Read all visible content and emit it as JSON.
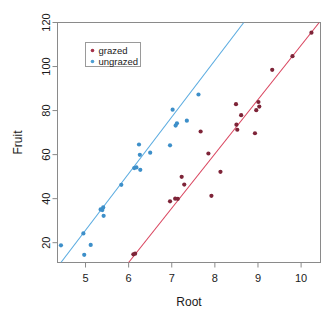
{
  "chart_data": {
    "type": "scatter",
    "title": "",
    "xlabel": "Root",
    "ylabel": "Fruit",
    "xlim": [
      4.35,
      10.45
    ],
    "ylim": [
      11.0,
      120.0
    ],
    "xticks": [
      5,
      6,
      7,
      8,
      9,
      10
    ],
    "yticks": [
      20,
      40,
      60,
      80,
      100,
      120
    ],
    "xtick_labels": [
      "5",
      "6",
      "7",
      "8",
      "9",
      "10"
    ],
    "ytick_labels": [
      "20",
      "40",
      "60",
      "80",
      "100",
      "120"
    ],
    "grid": false,
    "legend_position": "top-left",
    "legend": [
      {
        "name": "grazed",
        "color": "#a5324a",
        "marker": "filled-circle"
      },
      {
        "name": "ungrazed",
        "color": "#4e9fd4",
        "marker": "filled-circle"
      }
    ],
    "series": [
      {
        "name": "grazed",
        "color": "#7e2438",
        "marker": "filled-circle",
        "points": [
          {
            "x": 6.11,
            "y": 14.7
          },
          {
            "x": 6.15,
            "y": 15.0
          },
          {
            "x": 6.96,
            "y": 38.8
          },
          {
            "x": 7.08,
            "y": 40.0
          },
          {
            "x": 7.14,
            "y": 39.9
          },
          {
            "x": 7.23,
            "y": 49.9
          },
          {
            "x": 7.29,
            "y": 46.4
          },
          {
            "x": 7.67,
            "y": 70.5
          },
          {
            "x": 7.85,
            "y": 60.5
          },
          {
            "x": 7.92,
            "y": 41.3
          },
          {
            "x": 8.13,
            "y": 52.2
          },
          {
            "x": 8.49,
            "y": 82.9
          },
          {
            "x": 8.5,
            "y": 73.6
          },
          {
            "x": 8.52,
            "y": 71.3
          },
          {
            "x": 8.61,
            "y": 77.9
          },
          {
            "x": 8.93,
            "y": 69.7
          },
          {
            "x": 8.96,
            "y": 80.2
          },
          {
            "x": 9.01,
            "y": 83.9
          },
          {
            "x": 9.03,
            "y": 81.8
          },
          {
            "x": 9.33,
            "y": 98.5
          },
          {
            "x": 9.8,
            "y": 104.7
          },
          {
            "x": 10.24,
            "y": 115.4
          }
        ]
      },
      {
        "name": "ungrazed",
        "color": "#3d8fc9",
        "marker": "filled-circle",
        "points": [
          {
            "x": 4.43,
            "y": 18.8
          },
          {
            "x": 4.95,
            "y": 24.2
          },
          {
            "x": 4.97,
            "y": 14.5
          },
          {
            "x": 5.12,
            "y": 19.0
          },
          {
            "x": 5.35,
            "y": 35.1
          },
          {
            "x": 5.39,
            "y": 34.8
          },
          {
            "x": 5.42,
            "y": 32.2
          },
          {
            "x": 5.41,
            "y": 36.0
          },
          {
            "x": 5.83,
            "y": 46.3
          },
          {
            "x": 6.13,
            "y": 53.9
          },
          {
            "x": 6.18,
            "y": 54.2
          },
          {
            "x": 6.24,
            "y": 64.6
          },
          {
            "x": 6.27,
            "y": 53.1
          },
          {
            "x": 6.26,
            "y": 59.9
          },
          {
            "x": 6.5,
            "y": 60.9
          },
          {
            "x": 6.96,
            "y": 64.2
          },
          {
            "x": 7.02,
            "y": 80.4
          },
          {
            "x": 7.09,
            "y": 73.2
          },
          {
            "x": 7.12,
            "y": 74.2
          },
          {
            "x": 7.35,
            "y": 75.4
          },
          {
            "x": 7.62,
            "y": 87.3
          }
        ]
      }
    ],
    "fit_lines": [
      {
        "name": "grazed-fit",
        "color": "#d9455f",
        "x_start": 6.0,
        "y_start": 11.0,
        "x_end": 10.42,
        "y_end": 120.0
      },
      {
        "name": "ungrazed-fit",
        "color": "#5aabe0",
        "x_start": 4.43,
        "y_start": 11.0,
        "x_end": 8.67,
        "y_end": 120.0
      }
    ]
  }
}
